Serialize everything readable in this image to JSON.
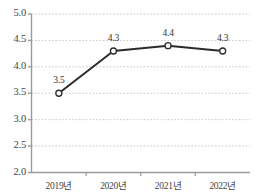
{
  "chart_data": {
    "type": "line",
    "title": "",
    "subtitle": "",
    "xlabel": "",
    "ylabel": "",
    "categories": [
      "2019년",
      "2020년",
      "2021년",
      "2022년"
    ],
    "values": [
      3.5,
      4.3,
      4.4,
      4.3
    ],
    "point_labels": [
      "3.5",
      "4.3",
      "4.4",
      "4.3"
    ],
    "series": [
      {
        "name": "",
        "values": [
          3.5,
          4.3,
          4.4,
          4.3
        ]
      }
    ],
    "ylim": [
      2.0,
      5.0
    ],
    "ytick_values": [
      5.0,
      4.5,
      4.0,
      3.5,
      3.0,
      2.5,
      2.0
    ],
    "ytick_labels": [
      "5.0",
      "4.5",
      "4.0",
      "3.5",
      "3.0",
      "2.5",
      "2.0"
    ],
    "grid": true,
    "grid_style": "dotted",
    "grid_color": "#c9c9c9",
    "legend": false,
    "legend_position": "none",
    "marker": "open-circle",
    "line_color": "#2b2b2b",
    "marker_fill": "#ffffff",
    "marker_stroke": "#2b2b2b",
    "axis_color": "#9a9a9a",
    "background": "#ffffff"
  }
}
